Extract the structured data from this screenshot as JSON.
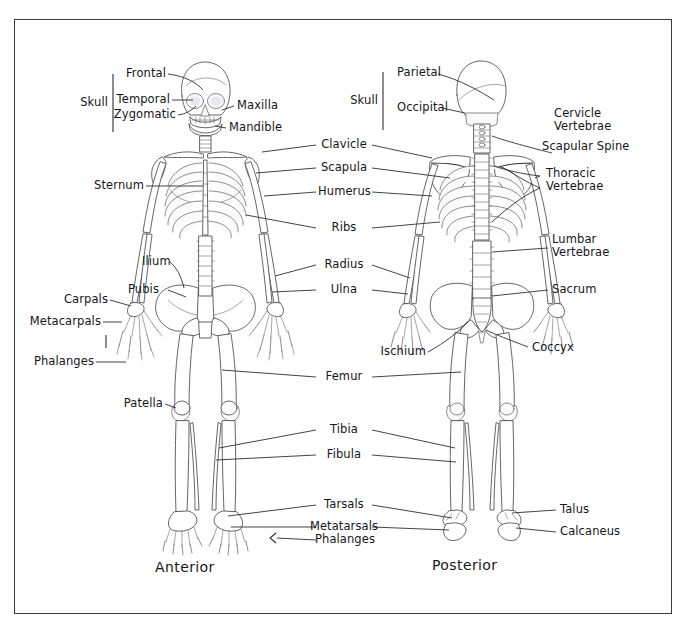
{
  "diagram": {
    "background_color": "#ffffff",
    "border_color": "#3b3b40",
    "ink_color": "#4a4a52"
  },
  "views": [
    {
      "id": "anterior",
      "caption": "Anterior"
    },
    {
      "id": "posterior",
      "caption": "Posterior"
    }
  ],
  "group_labels": [
    {
      "name": "skull-anterior",
      "text": "Skull"
    },
    {
      "name": "skull-posterior",
      "text": "Skull"
    }
  ],
  "anterior_labels": [
    {
      "name": "frontal",
      "text": "Frontal"
    },
    {
      "name": "temporal",
      "text": "Temporal"
    },
    {
      "name": "zygomatic",
      "text": "Zygomatic"
    },
    {
      "name": "maxilla",
      "text": "Maxilla"
    },
    {
      "name": "mandible",
      "text": "Mandible"
    },
    {
      "name": "sternum",
      "text": "Sternum"
    },
    {
      "name": "ilium",
      "text": "Ilium"
    },
    {
      "name": "pubis",
      "text": "Pubis"
    },
    {
      "name": "carpals",
      "text": "Carpals"
    },
    {
      "name": "metacarpals",
      "text": "Metacarpals"
    },
    {
      "name": "phalanges-hand",
      "text": "Phalanges"
    },
    {
      "name": "patella",
      "text": "Patella"
    }
  ],
  "center_labels": [
    {
      "name": "clavicle",
      "text": "Clavicle"
    },
    {
      "name": "scapula",
      "text": "Scapula"
    },
    {
      "name": "humerus",
      "text": "Humerus"
    },
    {
      "name": "ribs",
      "text": "Ribs"
    },
    {
      "name": "radius",
      "text": "Radius"
    },
    {
      "name": "ulna",
      "text": "Ulna"
    },
    {
      "name": "femur",
      "text": "Femur"
    },
    {
      "name": "tibia",
      "text": "Tibia"
    },
    {
      "name": "fibula",
      "text": "Fibula"
    },
    {
      "name": "tarsals",
      "text": "Tarsals"
    },
    {
      "name": "metatarsals",
      "text": "Metatarsals"
    },
    {
      "name": "phalanges-foot",
      "text": "Phalanges"
    }
  ],
  "posterior_labels": [
    {
      "name": "parietal",
      "text": "Parietal"
    },
    {
      "name": "occipital",
      "text": "Occipital"
    },
    {
      "name": "cervicle-vertebrae",
      "text": "Cervicle\nVertebrae"
    },
    {
      "name": "scapular-spine",
      "text": "Scapular Spine"
    },
    {
      "name": "thoracic-vertebrae",
      "text": "Thoracic\nVertebrae"
    },
    {
      "name": "lumbar-vertebrae",
      "text": "Lumbar\nVertebrae"
    },
    {
      "name": "sacrum",
      "text": "Sacrum"
    },
    {
      "name": "coccyx",
      "text": "Coccyx"
    },
    {
      "name": "ischium",
      "text": "Ischium"
    },
    {
      "name": "talus",
      "text": "Talus"
    },
    {
      "name": "calcaneus",
      "text": "Calcaneus"
    }
  ]
}
